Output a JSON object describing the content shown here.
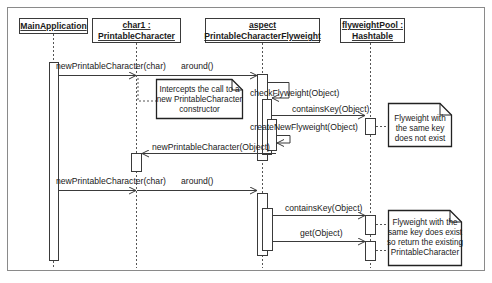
{
  "diagram": {
    "type": "uml-sequence-diagram",
    "colors": {
      "line": "#3a3a3a",
      "frame": "#8a8a8a",
      "background": "#ffffff",
      "text": "#1a1a1a"
    },
    "participants": [
      {
        "id": "main",
        "line1": "MainApplication",
        "line2": ""
      },
      {
        "id": "char1",
        "line1": "char1 :",
        "line2": "PrintableCharacter"
      },
      {
        "id": "aspect",
        "line1": "aspect",
        "line2": "PrintableCharacterFlyweight"
      },
      {
        "id": "pool",
        "line1": "flyweightPool :",
        "line2": "Hashtable"
      }
    ],
    "messages": [
      {
        "id": "m1",
        "label": "newPrintableCharacter(char)",
        "from": "main",
        "to": "char1"
      },
      {
        "id": "m2",
        "label": "around()",
        "from": "char1",
        "to": "aspect"
      },
      {
        "id": "m3",
        "label": "checkFlyweight(Object)",
        "from": "aspect",
        "to": "aspect"
      },
      {
        "id": "m4",
        "label": "containsKey(Object)",
        "from": "aspect",
        "to": "pool"
      },
      {
        "id": "m5",
        "label": "createNewFlyweight(Object)",
        "from": "aspect",
        "to": "aspect"
      },
      {
        "id": "m6",
        "label": "newPrintableCharacter(Object)",
        "from": "aspect",
        "to": "char1"
      },
      {
        "id": "m7",
        "label": "newPrintableCharacter(char)",
        "from": "main",
        "to": "char1"
      },
      {
        "id": "m8",
        "label": "around()",
        "from": "char1",
        "to": "aspect"
      },
      {
        "id": "m9",
        "label": "containsKey(Object)",
        "from": "aspect",
        "to": "pool"
      },
      {
        "id": "m10",
        "label": "get(Object)",
        "from": "aspect",
        "to": "pool"
      }
    ],
    "notes": [
      {
        "id": "n1",
        "lines": [
          "Intercepts the call to a",
          "new PrintableCharacter",
          "constructor"
        ]
      },
      {
        "id": "n2",
        "lines": [
          "Flyweight with",
          "the same key",
          "does not exist"
        ]
      },
      {
        "id": "n3",
        "lines": [
          "Flyweight with the",
          "same key does  exist",
          "so return the existing",
          "PrintableCharacter"
        ]
      }
    ]
  }
}
